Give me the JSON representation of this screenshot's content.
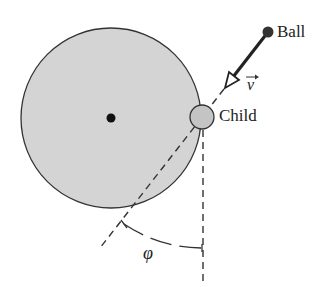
{
  "diagram": {
    "type": "physics-figure",
    "labels": {
      "ball": "Ball",
      "child": "Child",
      "velocity": "v",
      "angle": "φ"
    },
    "colors": {
      "merry_go_round_fill": "#d4d4d4",
      "child_fill": "#c4c4c4",
      "outline": "#333333",
      "ball": "#333333"
    },
    "elements": [
      {
        "name": "merry-go-round",
        "shape": "circle",
        "center": [
          111,
          118
        ],
        "radius": 90
      },
      {
        "name": "center-pivot",
        "shape": "dot",
        "center": [
          111,
          118
        ]
      },
      {
        "name": "child",
        "shape": "circle",
        "center": [
          202,
          117
        ],
        "radius": 12
      },
      {
        "name": "ball",
        "shape": "dot",
        "center": [
          268,
          32
        ]
      },
      {
        "name": "velocity-arrow",
        "from": [
          268,
          32
        ],
        "to": [
          226,
          86
        ]
      },
      {
        "name": "ball-path-dashed-line",
        "from": [
          226,
          86
        ],
        "to": [
          100,
          248
        ]
      },
      {
        "name": "vertical-dashed-line",
        "from": [
          203,
          130
        ],
        "to": [
          203,
          285
        ]
      },
      {
        "name": "angle-arc",
        "symbol": "φ"
      }
    ]
  }
}
